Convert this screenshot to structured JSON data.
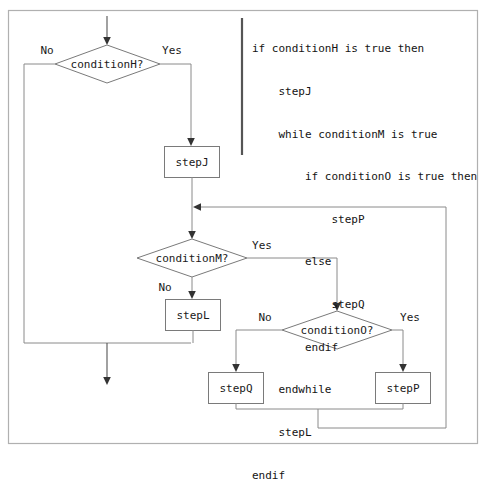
{
  "diagram": {
    "background_color": "#ffffff",
    "frame_color": "#b0b0b0",
    "node_border_color": "#7a7a7a",
    "connector_color": "#8a8a8a",
    "text_color": "#1a1a1a"
  },
  "pseudocode": {
    "lines": [
      "if conditionH is true then",
      "    stepJ",
      "    while conditionM is true",
      "        if conditionO is true then",
      "            stepP",
      "        else",
      "            stepQ",
      "        endif",
      "    endwhile",
      "    stepL",
      "endif"
    ]
  },
  "nodes": {
    "condition_h": {
      "label": "conditionH?",
      "shape": "diamond"
    },
    "step_j": {
      "label": "stepJ",
      "shape": "rectangle"
    },
    "condition_m": {
      "label": "conditionM?",
      "shape": "diamond"
    },
    "step_l": {
      "label": "stepL",
      "shape": "rectangle"
    },
    "condition_o": {
      "label": "conditionO?",
      "shape": "diamond"
    },
    "step_q": {
      "label": "stepQ",
      "shape": "rectangle"
    },
    "step_p": {
      "label": "stepP",
      "shape": "rectangle"
    }
  },
  "edge_labels": {
    "h_no": "No",
    "h_yes": "Yes",
    "m_no": "No",
    "m_yes": "Yes",
    "o_no": "No",
    "o_yes": "Yes"
  }
}
